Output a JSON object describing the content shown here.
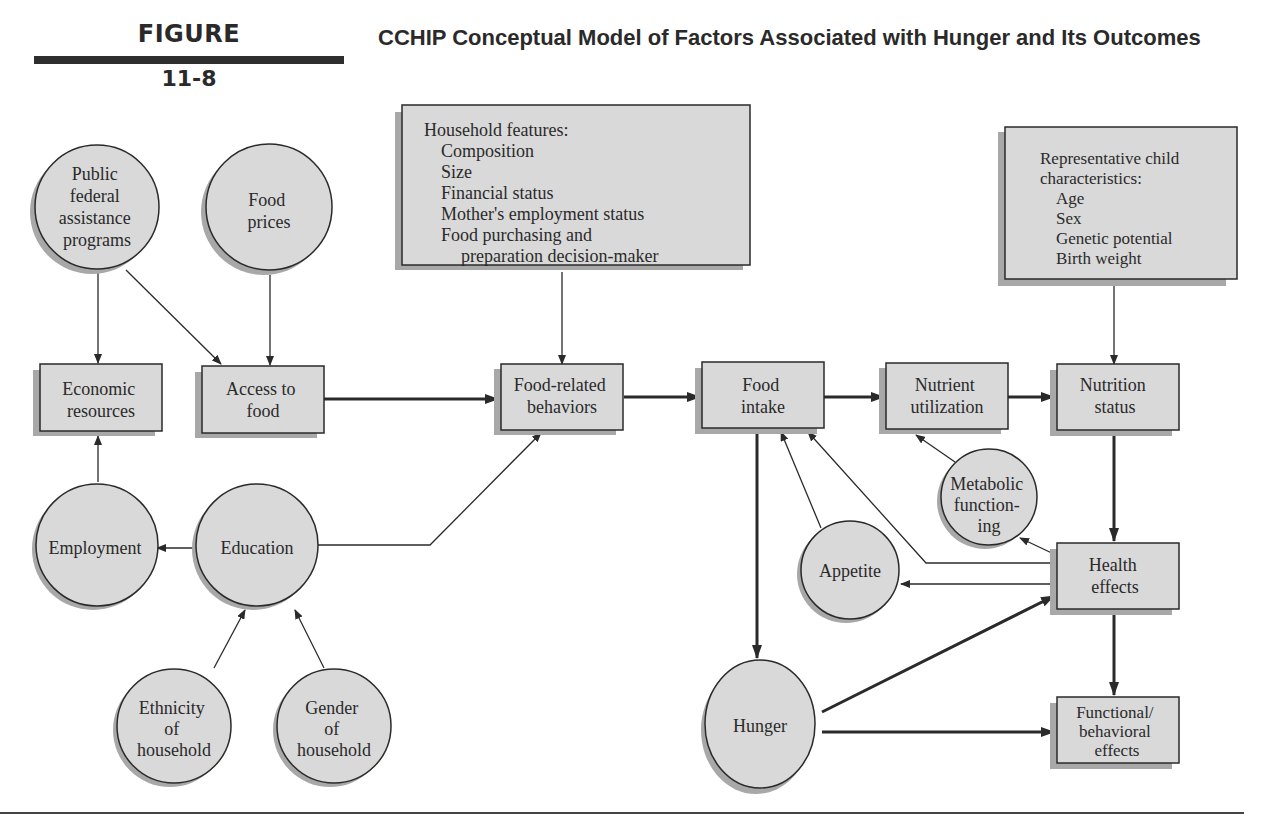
{
  "figure": {
    "label": "FIGURE",
    "number": "11-8",
    "title": "CCHIP Conceptual Model of Factors Associated with Hunger and Its Outcomes"
  },
  "colors": {
    "node_fill": "#d9d9d9",
    "node_shadow": "#a8a8a8",
    "stroke": "#2a2a2a",
    "text": "#2a2a2a"
  },
  "nodes": {
    "public_assistance": {
      "shape": "circle",
      "lines": [
        "Public",
        "federal",
        "assistance",
        "programs"
      ]
    },
    "food_prices": {
      "shape": "circle",
      "lines": [
        "Food",
        "prices"
      ]
    },
    "household_features": {
      "shape": "box",
      "heading": "Household features:",
      "items": [
        "Composition",
        "Size",
        "Financial status",
        "Mother's employment status",
        "Food purchasing and",
        "preparation decision-maker"
      ]
    },
    "child_characteristics": {
      "shape": "box",
      "heading_lines": [
        "Representative child",
        "characteristics:"
      ],
      "items": [
        "Age",
        "Sex",
        "Genetic potential",
        "Birth weight"
      ]
    },
    "economic_resources": {
      "shape": "box",
      "lines": [
        "Economic",
        "resources"
      ]
    },
    "access_to_food": {
      "shape": "box",
      "lines": [
        "Access to",
        "food"
      ]
    },
    "food_related_behaviors": {
      "shape": "box",
      "lines": [
        "Food-related",
        "behaviors"
      ]
    },
    "food_intake": {
      "shape": "box",
      "lines": [
        "Food",
        "intake"
      ]
    },
    "nutrient_utilization": {
      "shape": "box",
      "lines": [
        "Nutrient",
        "utilization"
      ]
    },
    "nutrition_status": {
      "shape": "box",
      "lines": [
        "Nutrition",
        "status"
      ]
    },
    "employment": {
      "shape": "circle",
      "lines": [
        "Employment"
      ]
    },
    "education": {
      "shape": "circle",
      "lines": [
        "Education"
      ]
    },
    "ethnicity": {
      "shape": "circle",
      "lines": [
        "Ethnicity",
        "of",
        "household"
      ]
    },
    "gender": {
      "shape": "circle",
      "lines": [
        "Gender",
        "of",
        "household"
      ]
    },
    "metabolic_functioning": {
      "shape": "circle",
      "lines": [
        "Metabolic",
        "function-",
        "ing"
      ]
    },
    "appetite": {
      "shape": "circle",
      "lines": [
        "Appetite"
      ]
    },
    "health_effects": {
      "shape": "box",
      "lines": [
        "Health",
        "effects"
      ]
    },
    "hunger": {
      "shape": "circle",
      "lines": [
        "Hunger"
      ]
    },
    "functional_effects": {
      "shape": "box",
      "lines": [
        "Functional/",
        "behavioral",
        "effects"
      ]
    }
  },
  "edges": [
    {
      "from": "public_assistance",
      "to": "economic_resources"
    },
    {
      "from": "public_assistance",
      "to": "access_to_food"
    },
    {
      "from": "food_prices",
      "to": "access_to_food"
    },
    {
      "from": "employment",
      "to": "economic_resources"
    },
    {
      "from": "education",
      "to": "employment"
    },
    {
      "from": "education",
      "to": "food_related_behaviors"
    },
    {
      "from": "ethnicity",
      "to": "education"
    },
    {
      "from": "gender",
      "to": "education"
    },
    {
      "from": "access_to_food",
      "to": "food_related_behaviors"
    },
    {
      "from": "household_features",
      "to": "food_related_behaviors"
    },
    {
      "from": "food_related_behaviors",
      "to": "food_intake"
    },
    {
      "from": "food_intake",
      "to": "nutrient_utilization"
    },
    {
      "from": "nutrient_utilization",
      "to": "nutrition_status"
    },
    {
      "from": "child_characteristics",
      "to": "nutrition_status"
    },
    {
      "from": "nutrition_status",
      "to": "health_effects"
    },
    {
      "from": "metabolic_functioning",
      "to": "nutrient_utilization"
    },
    {
      "from": "health_effects",
      "to": "metabolic_functioning"
    },
    {
      "from": "appetite",
      "to": "food_intake"
    },
    {
      "from": "health_effects",
      "to": "food_intake"
    },
    {
      "from": "health_effects",
      "to": "appetite"
    },
    {
      "from": "food_intake",
      "to": "hunger"
    },
    {
      "from": "hunger",
      "to": "health_effects"
    },
    {
      "from": "hunger",
      "to": "functional_effects"
    },
    {
      "from": "health_effects",
      "to": "functional_effects"
    }
  ]
}
